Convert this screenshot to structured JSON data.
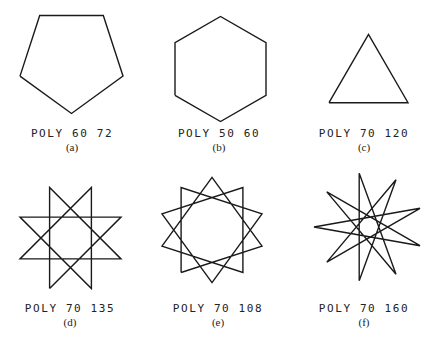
{
  "figure": {
    "panels": [
      {
        "id": "a",
        "command": "POLY 60 72",
        "caption": "(a)",
        "side": 60,
        "angle": 72,
        "shape": "pentagon"
      },
      {
        "id": "b",
        "command": "POLY 50 60",
        "caption": "(b)",
        "side": 50,
        "angle": 60,
        "shape": "hexagon"
      },
      {
        "id": "c",
        "command": "POLY 70 120",
        "caption": "(c)",
        "side": 70,
        "angle": 120,
        "shape": "triangle"
      },
      {
        "id": "d",
        "command": "POLY 70 135",
        "caption": "(d)",
        "side": 70,
        "angle": 135,
        "shape": "8-point star"
      },
      {
        "id": "e",
        "command": "POLY 70 108",
        "caption": "(e)",
        "side": 70,
        "angle": 108,
        "shape": "10-point star"
      },
      {
        "id": "f",
        "command": "POLY 70 160",
        "caption": "(f)",
        "side": 70,
        "angle": 160,
        "shape": "9-point star"
      }
    ]
  },
  "style": {
    "stroke": "#1a1a1a",
    "text": "#222222",
    "background": "#ffffff"
  }
}
